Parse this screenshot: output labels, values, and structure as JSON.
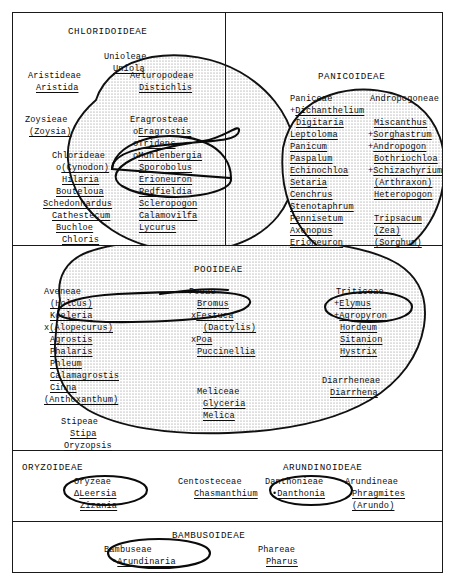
{
  "diagram": {
    "frame_color": "#1a1a1a",
    "stipple_color": "#5a5a5a",
    "ring_color": "#101010"
  },
  "sections": {
    "chloridoideae": {
      "name": "CHLORIDOIDEAE",
      "groups": [
        {
          "tribe": "Unioleae",
          "genera": [
            {
              "prefix": "",
              "name": "Uniola",
              "underline": true
            }
          ]
        },
        {
          "tribe": "Aristideae",
          "genera": [
            {
              "prefix": "",
              "name": "Aristida",
              "underline": true
            }
          ]
        },
        {
          "tribe": "Aeluropodeae",
          "genera": [
            {
              "prefix": "",
              "name": "Distichlis",
              "underline": true
            }
          ]
        },
        {
          "tribe": "Zoysieae",
          "genera": [
            {
              "prefix": "",
              "name": "(Zoysia)",
              "underline": true
            }
          ]
        },
        {
          "tribe": "Eragrosteae",
          "genera": [
            {
              "prefix": "o",
              "name": "Eragrostis",
              "underline": true
            },
            {
              "prefix": "o",
              "name": "Tridens",
              "underline": true
            },
            {
              "prefix": "o",
              "name": "Muhlenbergia",
              "underline": true
            },
            {
              "prefix": "",
              "name": "Sporobolus",
              "underline": true
            },
            {
              "prefix": "",
              "name": "Erioneuron",
              "underline": true
            },
            {
              "prefix": "",
              "name": "Redfieldia",
              "underline": true
            },
            {
              "prefix": "",
              "name": "Scleropogon",
              "underline": true
            },
            {
              "prefix": "",
              "name": "Calamovilfa",
              "underline": true
            },
            {
              "prefix": "",
              "name": "Lycurus",
              "underline": true
            }
          ]
        },
        {
          "tribe": "Chlorideae",
          "genera": [
            {
              "prefix": "o",
              "name": "(Cynodon)",
              "underline": true
            },
            {
              "prefix": "",
              "name": "Hilaria",
              "underline": true
            },
            {
              "prefix": "",
              "name": "Bouteloua",
              "underline": true
            },
            {
              "prefix": "",
              "name": "Schedonnardus",
              "underline": true
            },
            {
              "prefix": "",
              "name": "Cathestecum",
              "underline": true
            },
            {
              "prefix": "",
              "name": "Buchloe",
              "underline": true
            },
            {
              "prefix": "",
              "name": "Chloris",
              "underline": true
            }
          ]
        }
      ]
    },
    "panicoideae": {
      "name": "PANICOIDEAE",
      "groups": [
        {
          "tribe": "Paniceae",
          "genera": [
            {
              "prefix": "+",
              "name": "Dichanthelium",
              "underline": true
            },
            {
              "prefix": "",
              "name": "Digitaria",
              "underline": true
            },
            {
              "prefix": "",
              "name": "Leptoloma",
              "underline": true
            },
            {
              "prefix": "",
              "name": "Panicum",
              "underline": true
            },
            {
              "prefix": "",
              "name": "Paspalum",
              "underline": true
            },
            {
              "prefix": "",
              "name": "Echinochloa",
              "underline": true
            },
            {
              "prefix": "",
              "name": "Setaria",
              "underline": true
            },
            {
              "prefix": "",
              "name": "Cenchrus",
              "underline": true
            },
            {
              "prefix": "",
              "name": "Stenotaphrum",
              "underline": true
            },
            {
              "prefix": "",
              "name": "Pennisetum",
              "underline": true
            },
            {
              "prefix": "",
              "name": "Axonopus",
              "underline": true
            },
            {
              "prefix": "",
              "name": "Erioneuron",
              "underline": true
            }
          ]
        },
        {
          "tribe": "Andropogoneae",
          "genera": [
            {
              "prefix": "",
              "name": "Miscanthus",
              "underline": true
            },
            {
              "prefix": "+",
              "name": "Sorghastrum",
              "underline": true
            },
            {
              "prefix": "+",
              "name": "Andropogon",
              "underline": true
            },
            {
              "prefix": "",
              "name": "Bothriochloa",
              "underline": true
            },
            {
              "prefix": "+",
              "name": "Schizachyrium",
              "underline": true
            },
            {
              "prefix": "",
              "name": "(Arthraxon)",
              "underline": true
            },
            {
              "prefix": "",
              "name": "Heteropogon",
              "underline": true
            },
            {
              "prefix": "",
              "name": "Tripsacum",
              "underline": true
            },
            {
              "prefix": "",
              "name": "(Zea)",
              "underline": true
            },
            {
              "prefix": "",
              "name": "(Sorghum)",
              "underline": true
            }
          ]
        }
      ]
    },
    "pooideae": {
      "name": "POOIDEAE",
      "groups": [
        {
          "tribe": "Aveneae",
          "genera": [
            {
              "prefix": "",
              "name": "(Holcus)",
              "underline": true
            },
            {
              "prefix": "",
              "name": "Koeleria",
              "underline": true
            },
            {
              "prefix": "x",
              "name": "(Alopecurus)",
              "underline": true
            },
            {
              "prefix": "",
              "name": "Agrostis",
              "underline": true
            },
            {
              "prefix": "",
              "name": "Phalaris",
              "underline": true
            },
            {
              "prefix": "",
              "name": "Phleum",
              "underline": true
            },
            {
              "prefix": "",
              "name": "Calamagrostis",
              "underline": true
            },
            {
              "prefix": "",
              "name": "Cinna",
              "underline": true
            },
            {
              "prefix": "",
              "name": "(Anthoxanthum)",
              "underline": true
            }
          ]
        },
        {
          "tribe": "Stipeae",
          "genera": [
            {
              "prefix": "",
              "name": "Stipa",
              "underline": true
            },
            {
              "prefix": "",
              "name": "Oryzopsis",
              "underline": true
            }
          ]
        },
        {
          "tribe": "Poeae",
          "genera": [
            {
              "prefix": "",
              "name": "Bromus",
              "underline": true
            },
            {
              "prefix": "x",
              "name": "Festuca",
              "underline": true
            },
            {
              "prefix": "",
              "name": "(Dactylis)",
              "underline": true
            },
            {
              "prefix": "x",
              "name": "Poa",
              "underline": true
            },
            {
              "prefix": "",
              "name": "Puccinellia",
              "underline": true
            }
          ]
        },
        {
          "tribe": "Meliceae",
          "genera": [
            {
              "prefix": "",
              "name": "Glyceria",
              "underline": true
            },
            {
              "prefix": "",
              "name": "Melica",
              "underline": true
            }
          ]
        },
        {
          "tribe": "Triticeae",
          "genera": [
            {
              "prefix": "+",
              "name": "Elymus",
              "underline": true
            },
            {
              "prefix": "+",
              "name": "Agropyron",
              "underline": true
            },
            {
              "prefix": "",
              "name": "Hordeum",
              "underline": true
            },
            {
              "prefix": "",
              "name": "Sitanion",
              "underline": true
            },
            {
              "prefix": "",
              "name": "Hystrix",
              "underline": true
            }
          ]
        },
        {
          "tribe": "Diarrheneae",
          "genera": [
            {
              "prefix": "",
              "name": "Diarrhena",
              "underline": true
            }
          ]
        }
      ]
    },
    "oryzoideae": {
      "name": "ORYZOIDEAE",
      "groups": [
        {
          "tribe": "Oryzeae",
          "genera": [
            {
              "prefix": "Δ",
              "name": "Leersia",
              "underline": true
            },
            {
              "prefix": "",
              "name": "Zizania",
              "underline": true
            }
          ]
        }
      ]
    },
    "arundinoideae": {
      "name": "ARUNDINOIDEAE",
      "groups": [
        {
          "tribe": "Centosteceae",
          "genera": [
            {
              "prefix": "",
              "name": "Chasmanthium",
              "underline": true
            }
          ]
        },
        {
          "tribe": "Danthonieae",
          "genera": [
            {
              "prefix": "•",
              "name": "Danthonia",
              "underline": true
            }
          ]
        },
        {
          "tribe": "Arundineae",
          "genera": [
            {
              "prefix": "",
              "name": "Phragmites",
              "underline": true
            },
            {
              "prefix": "",
              "name": "(Arundo)",
              "underline": true
            }
          ]
        }
      ]
    },
    "bambusoideae": {
      "name": "BAMBUSOIDEAE",
      "groups": [
        {
          "tribe": "Bambuseae",
          "genera": [
            {
              "prefix": "•",
              "name": "Arundinaria",
              "underline": true
            }
          ]
        },
        {
          "tribe": "Phareae",
          "genera": [
            {
              "prefix": "",
              "name": "Pharus",
              "underline": true
            }
          ]
        }
      ]
    }
  },
  "labels": {
    "chloridoideae_heading": "CHLORIDOIDEAE",
    "panicoideae_heading": "PANICOIDEAE",
    "pooideae_heading": "POOIDEAE",
    "oryzoideae_heading": "ORYZOIDEAE",
    "arundinoideae_heading": "ARUNDINOIDEAE",
    "bambusoideae_heading": "BAMBUSOIDEAE",
    "t_unioleae": "Unioleae",
    "g_uniola": "Uniola",
    "t_aristideae": "Aristideae",
    "g_aristida": "Aristida",
    "t_aeluropodeae": "Aeluropodeae",
    "g_distichlis": "Distichlis",
    "t_zoysieae": "Zoysieae",
    "g_zoysia": "(Zoysia)",
    "t_eragrosteae": "Eragrosteae",
    "g_eragrostis": "Eragrostis",
    "g_tridens": "Tridens",
    "g_muhlenbergia": "Muhlenbergia",
    "g_sporobolus": "Sporobolus",
    "g_erioneuron_c": "Erioneuron",
    "g_redfieldia": "Redfieldia",
    "g_scleropogon": "Scleropogon",
    "g_calamovilfa": "Calamovilfa",
    "g_lycurus": "Lycurus",
    "t_chlorideae": "Chlorideae",
    "g_cynodon": "(Cynodon)",
    "g_hilaria": "Hilaria",
    "g_bouteloua": "Bouteloua",
    "g_schedonnardus": "Schedonnardus",
    "g_cathestecum": "Cathestecum",
    "g_buchloe": "Buchloe",
    "g_chloris": "Chloris",
    "t_paniceae": "Paniceae",
    "g_dichanthelium": "Dichanthelium",
    "g_digitaria": "Digitaria",
    "g_leptoloma": "Leptoloma",
    "g_panicum": "Panicum",
    "g_paspalum": "Paspalum",
    "g_echinochloa": "Echinochloa",
    "g_setaria": "Setaria",
    "g_cenchrus": "Cenchrus",
    "g_stenotaphrum": "Stenotaphrum",
    "g_pennisetum": "Pennisetum",
    "g_axonopus": "Axonopus",
    "g_erioneuron_p": "Erioneuron",
    "t_andropogoneae": "Andropogoneae",
    "g_miscanthus": "Miscanthus",
    "g_sorghastrum": "Sorghastrum",
    "g_andropogon": "Andropogon",
    "g_bothriochloa": "Bothriochloa",
    "g_schizachyrium": "Schizachyrium",
    "g_arthraxon": "(Arthraxon)",
    "g_heteropogon": "Heteropogon",
    "g_tripsacum": "Tripsacum",
    "g_zea": "(Zea)",
    "g_sorghum": "(Sorghum)",
    "t_aveneae": "Aveneae",
    "g_holcus": "(Holcus)",
    "g_koeleria": "Koeleria",
    "g_alopecurus": "(Alopecurus)",
    "g_agrostis": "Agrostis",
    "g_phalaris": "Phalaris",
    "g_phleum": "Phleum",
    "g_calamagrostis": "Calamagrostis",
    "g_cinna": "Cinna",
    "g_anthoxanthum": "(Anthoxanthum)",
    "t_stipeae": "Stipeae",
    "g_stipa": "Stipa",
    "g_oryzopsis": "Oryzopsis",
    "t_poeae": "Poeae",
    "g_bromus": "Bromus",
    "g_festuca": "Festuca",
    "g_dactylis": "(Dactylis)",
    "g_poa": "Poa",
    "g_puccinellia": "Puccinellia",
    "t_meliceae": "Meliceae",
    "g_glyceria": "Glyceria",
    "g_melica": "Melica",
    "t_triticeae": "Triticeae",
    "g_elymus": "Elymus",
    "g_agropyron": "Agropyron",
    "g_hordeum": "Hordeum",
    "g_sitanion": "Sitanion",
    "g_hystrix": "Hystrix",
    "t_diarrheneae": "Diarrheneae",
    "g_diarrhena": "Diarrhena",
    "t_oryzeae": "Oryzeae",
    "g_leersia": "Leersia",
    "g_zizania": "Zizania",
    "t_centosteceae": "Centosteceae",
    "g_chasmanthium": "Chasmanthium",
    "t_danthonieae": "Danthonieae",
    "g_danthonia": "Danthonia",
    "t_arundineae": "Arundineae",
    "g_phragmites": "Phragmites",
    "g_arundo": "(Arundo)",
    "t_bambuseae": "Bambuseae",
    "g_arundinaria": "Arundinaria",
    "t_phareae": "Phareae",
    "g_pharus": "Pharus",
    "p_o": "o",
    "p_plus": "+",
    "p_x": "x",
    "p_dot": "•",
    "p_tri": "Δ"
  }
}
